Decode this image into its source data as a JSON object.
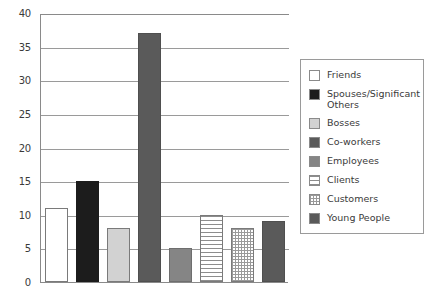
{
  "chart_data": {
    "type": "bar",
    "title": "",
    "subtitle": "",
    "xlabel": "",
    "ylabel": "",
    "ylim": [
      0,
      40
    ],
    "ytick_step": 5,
    "ytick_labels": [
      "40",
      "35",
      "30",
      "25",
      "20",
      "15",
      "10",
      "5",
      "0"
    ],
    "ytick_values": [
      40,
      35,
      30,
      25,
      20,
      15,
      10,
      5,
      0
    ],
    "grid": true,
    "grid_axis": "y",
    "legend_position": "right",
    "categories": [
      "Friends",
      "Spouses/Significant Others",
      "Bosses",
      "Co-workers",
      "Employees",
      "Clients",
      "Customers",
      "Young People"
    ],
    "values": [
      11,
      15,
      8,
      37,
      5,
      10,
      8,
      9
    ],
    "bars": [
      {
        "label": "Friends",
        "value": 11,
        "fill": "white",
        "fill_color": "#ffffff"
      },
      {
        "label": "Spouses/Significant Others",
        "value": 15,
        "fill": "solid-black",
        "fill_color": "#1c1c1c"
      },
      {
        "label": "Bosses",
        "value": 8,
        "fill": "solid-light-gray",
        "fill_color": "#d2d2d2"
      },
      {
        "label": "Co-workers",
        "value": 37,
        "fill": "solid-dark-gray",
        "fill_color": "#5a5a5a"
      },
      {
        "label": "Employees",
        "value": 5,
        "fill": "solid-mid-gray",
        "fill_color": "#858585"
      },
      {
        "label": "Clients",
        "value": 10,
        "fill": "horizontal-stripes",
        "fill_color": "#8d8d8d"
      },
      {
        "label": "Customers",
        "value": 8,
        "fill": "checkerboard",
        "fill_color": "#9a9a9a"
      },
      {
        "label": "Young People",
        "value": 9,
        "fill": "solid-dark-gray",
        "fill_color": "#5a5a5a"
      }
    ]
  },
  "legend": {
    "items": [
      {
        "label": "Friends",
        "swatch": "white"
      },
      {
        "label": "Spouses/Significant\nOthers",
        "swatch": "solid-black"
      },
      {
        "label": "Bosses",
        "swatch": "solid-light-gray"
      },
      {
        "label": "Co-workers",
        "swatch": "solid-dark-gray"
      },
      {
        "label": "Employees",
        "swatch": "solid-mid-gray"
      },
      {
        "label": "Clients",
        "swatch": "horizontal-stripes"
      },
      {
        "label": "Customers",
        "swatch": "checkerboard"
      },
      {
        "label": "Young People",
        "swatch": "solid-dark-gray"
      }
    ]
  },
  "colors": {
    "axis": "#8a8a8a",
    "gridline": "#9a9a9a",
    "text": "#3a3a3a",
    "background": "#ffffff",
    "bar_border": "#7a7a7a"
  }
}
